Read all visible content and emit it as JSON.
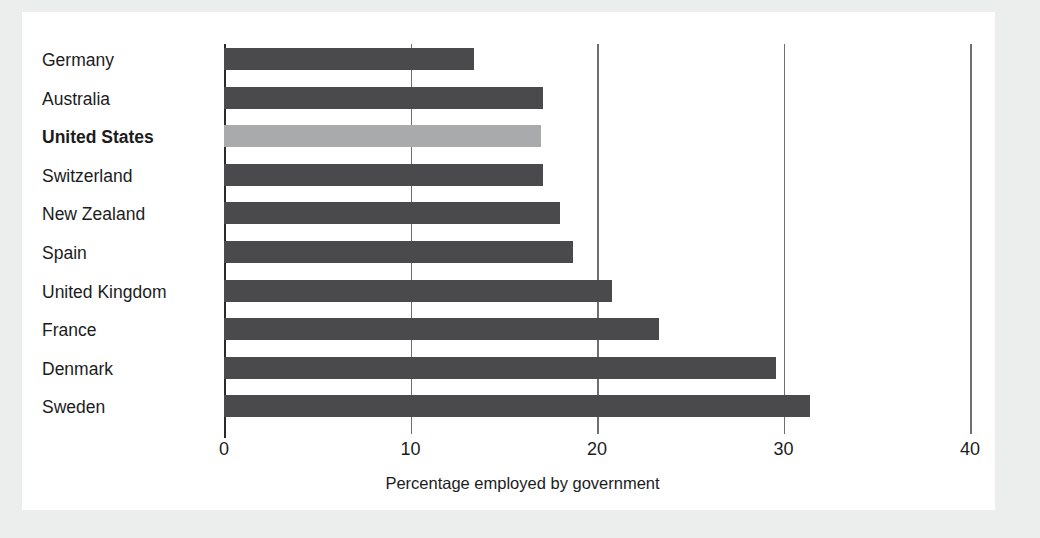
{
  "chart_data": {
    "type": "bar",
    "orientation": "horizontal",
    "title": "",
    "xlabel": "Percentage employed by government",
    "ylabel": "",
    "xlim": [
      0,
      40
    ],
    "xticks": [
      0,
      10,
      20,
      30,
      40
    ],
    "xtick_labels": [
      "0",
      "10",
      "20",
      "30",
      "40"
    ],
    "grid": "vertical",
    "legend": "none",
    "categories": [
      "Germany",
      "Australia",
      "United States",
      "Switzerland",
      "New Zealand",
      "Spain",
      "United Kingdom",
      "France",
      "Denmark",
      "Sweden"
    ],
    "values": [
      13.4,
      17.1,
      17.0,
      17.1,
      18.0,
      18.7,
      20.8,
      23.3,
      29.6,
      31.4
    ],
    "highlight_category": "United States",
    "colors": {
      "bar": "#4a4a4c",
      "bar_highlight": "#a9aaac",
      "axis": "#2a2a2a",
      "grid": "#6d6e70",
      "text": "#1c1c1c",
      "card_background": "#ffffff",
      "page_background": "#eceded"
    }
  }
}
